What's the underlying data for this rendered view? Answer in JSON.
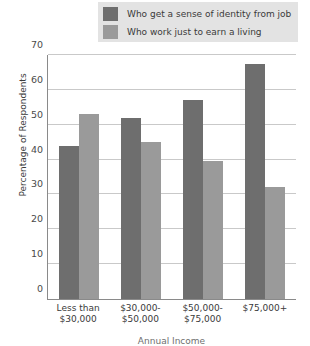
{
  "chart_data": {
    "type": "bar",
    "title": "",
    "xlabel": "Annual Income",
    "ylabel": "Percentage of Respondents",
    "categories": [
      "Less than $30,000",
      "$30,000-$50,000",
      "$50,000-$75,000",
      "$75,000+"
    ],
    "category_lines": [
      [
        "Less than",
        "$30,000"
      ],
      [
        "$30,000-",
        "$50,000"
      ],
      [
        "$50,000-",
        "$75,000"
      ],
      [
        "$75,000+",
        ""
      ]
    ],
    "series": [
      {
        "name": "Who get a sense of identity from job",
        "color": "#6e6e6e",
        "values": [
          44,
          52,
          57,
          67.5
        ]
      },
      {
        "name": "Who work just to earn a living",
        "color": "#9a9a9a",
        "values": [
          53,
          45,
          39.5,
          32
        ]
      }
    ],
    "ylim": [
      0,
      70
    ],
    "yticks": [
      0,
      10,
      20,
      30,
      40,
      50,
      60,
      70
    ],
    "ytick_labels": [
      "0",
      "10",
      "20",
      "30",
      "40",
      "50",
      "60",
      "70"
    ],
    "grid": true,
    "legend_position": "top"
  }
}
